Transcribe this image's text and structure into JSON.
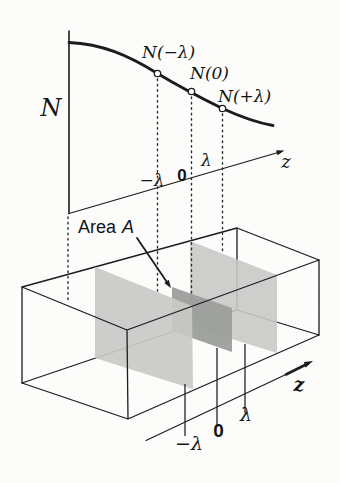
{
  "figure": {
    "background_color": "#fcfcfb",
    "ink_color": "#1c1c1c",
    "plane_light_color": "#c9cac7",
    "plane_dark_color": "#9b9e9b"
  },
  "graph": {
    "y_axis_label": "N",
    "z_axis_label": "z",
    "point_labels": {
      "minus_lambda": "N(−λ)",
      "zero": "N(0)",
      "plus_lambda": "N(+λ)"
    },
    "tick_labels": {
      "minus_lambda": "−λ",
      "zero": "0",
      "plus_lambda": "λ"
    }
  },
  "box": {
    "area_label": {
      "word": "Area",
      "symbol": "A"
    },
    "z_axis_label": "z",
    "tick_labels": {
      "minus_lambda": "−λ",
      "zero": "0",
      "plus_lambda": "λ"
    }
  }
}
